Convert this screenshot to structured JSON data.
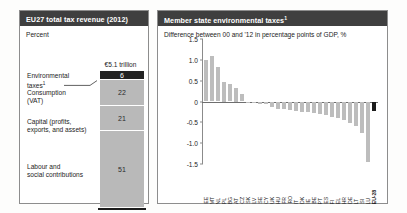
{
  "left_panel": {
    "header": "EU27 total tax revenue (2012)",
    "subtitle": "Percent",
    "bar_caption": "€5.1 trillion",
    "segments": [
      {
        "label": "Environmental taxes",
        "footnote": "1",
        "value": 6,
        "value_text": "6",
        "style": "dark"
      },
      {
        "label": "Consumption (VAT)",
        "footnote": "",
        "value": 22,
        "value_text": "22",
        "style": "light"
      },
      {
        "label": "Capital (profits, exports, and assets)",
        "footnote": "",
        "value": 21,
        "value_text": "21",
        "style": "light"
      },
      {
        "label": "Labour and social contributions",
        "footnote": "",
        "value": 51,
        "value_text": "51",
        "style": "light"
      }
    ],
    "category_labels": [
      {
        "line1": "Environmental",
        "line2": "taxes",
        "footnote": "1"
      },
      {
        "line1": "Consumption",
        "line2": "(VAT)",
        "footnote": ""
      },
      {
        "line1": "Capital (profits,",
        "line2": "exports, and assets)",
        "footnote": ""
      },
      {
        "line1": "Labour and",
        "line2": "social contributions",
        "footnote": ""
      }
    ]
  },
  "right_panel": {
    "header": "Member state environmental taxes",
    "header_footnote": "1",
    "subtitle": "Difference between 00 and '12 in percentage points of GDP, %"
  },
  "colors": {
    "header_bg": "#3f3f3f",
    "bar_light": "#bdbdbd",
    "bar_dark": "#1c1c1c",
    "axis": "#8b8b8b",
    "text": "#1d1d1d"
  },
  "chart_data": {
    "type": "bar",
    "title": "Member state environmental taxes",
    "subtitle": "Difference between 00 and '12 in percentage points of GDP, %",
    "xlabel": "",
    "ylabel": "",
    "ylim": [
      -1.5,
      1.5
    ],
    "yticks": [
      1.5,
      1.0,
      0.5,
      0,
      -0.5,
      -1.0,
      -1.5
    ],
    "ytick_labels": [
      "1.5",
      "1.0",
      "0.5",
      "0",
      "-0.5",
      "-1.0",
      "-1.5"
    ],
    "grid": false,
    "legend": "none",
    "categories": [
      "EE",
      "MT",
      "NL",
      "PL",
      "BG",
      "AT",
      "CZ",
      "SK",
      "LV",
      "SE",
      "CY",
      "UK",
      "HU",
      "FR",
      "RO",
      "IT",
      "DK",
      "IE",
      "BE",
      "PT",
      "ES",
      "FI",
      "EL",
      "HR",
      "DE",
      "LT",
      "SI",
      "LU",
      "EU-28"
    ],
    "values": [
      1.0,
      1.1,
      0.82,
      0.48,
      0.41,
      0.33,
      0.17,
      0.0,
      -0.03,
      -0.05,
      -0.07,
      -0.13,
      -0.17,
      -0.18,
      -0.2,
      -0.22,
      -0.24,
      -0.26,
      -0.28,
      -0.3,
      -0.33,
      -0.36,
      -0.4,
      -0.44,
      -0.52,
      -0.58,
      -0.75,
      -1.45,
      -0.22
    ],
    "highlight_index": 28,
    "highlight_label": "EU-28"
  }
}
